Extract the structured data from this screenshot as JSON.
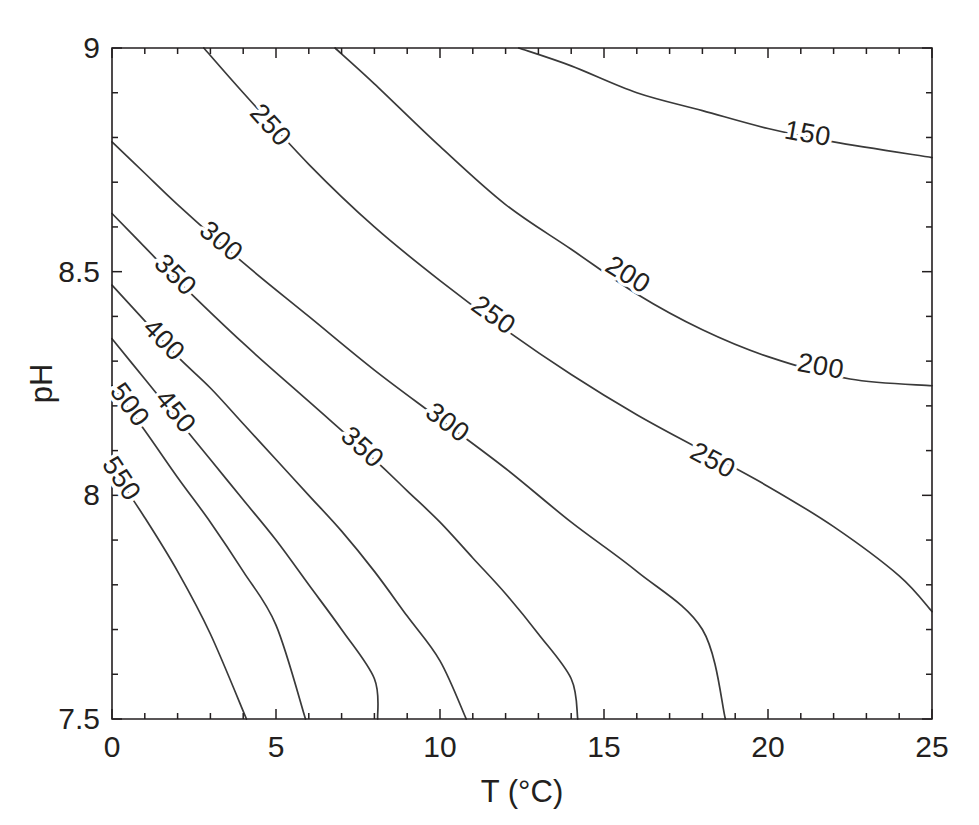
{
  "chart_data": {
    "type": "contour",
    "title": "",
    "xlabel": "T (°C)",
    "ylabel": "pH",
    "xlim": [
      0,
      25
    ],
    "ylim": [
      7.5,
      9
    ],
    "xticks": [
      0,
      5,
      10,
      15,
      20,
      25
    ],
    "xtick_labels": [
      "0",
      "5",
      "10",
      "15",
      "20",
      "25"
    ],
    "xminor_step": 1,
    "yticks": [
      7.5,
      8,
      8.5,
      9
    ],
    "ytick_labels": [
      "7.5",
      "8",
      "8.5",
      "9"
    ],
    "yminor_step": 0.1,
    "grid": false,
    "legend": "none",
    "levels": [
      150,
      200,
      250,
      300,
      350,
      400,
      450,
      500,
      550
    ],
    "level_unit": "",
    "line_color": "#3a3a3a",
    "axis_color": "#231f20",
    "background": "#ffffff",
    "contours": [
      {
        "level": 150,
        "label": "150",
        "points": [
          [
            12.4,
            9.0
          ],
          [
            14.0,
            8.96
          ],
          [
            16.0,
            8.9
          ],
          [
            18.0,
            8.86
          ],
          [
            20.0,
            8.82
          ],
          [
            22.0,
            8.79
          ],
          [
            25.0,
            8.755
          ]
        ],
        "label_at": [
          21.2,
          8.805
        ]
      },
      {
        "level": 200,
        "label": "200",
        "points": [
          [
            6.8,
            9.0
          ],
          [
            8.0,
            8.92
          ],
          [
            10.0,
            8.78
          ],
          [
            12.0,
            8.65
          ],
          [
            14.0,
            8.55
          ],
          [
            16.0,
            8.45
          ],
          [
            18.0,
            8.37
          ],
          [
            20.0,
            8.31
          ],
          [
            22.5,
            8.26
          ],
          [
            25.0,
            8.245
          ]
        ],
        "label_at": [
          15.7,
          8.49
        ],
        "label_at_2": [
          21.6,
          8.285
        ],
        "label2": "200"
      },
      {
        "level": 250,
        "label": "250",
        "points": [
          [
            2.8,
            9.0
          ],
          [
            4.0,
            8.9
          ],
          [
            6.0,
            8.74
          ],
          [
            8.0,
            8.6
          ],
          [
            10.0,
            8.48
          ],
          [
            12.0,
            8.37
          ],
          [
            14.0,
            8.27
          ],
          [
            16.0,
            8.18
          ],
          [
            18.0,
            8.1
          ],
          [
            20.0,
            8.02
          ],
          [
            22.0,
            7.93
          ],
          [
            24.0,
            7.82
          ],
          [
            25.0,
            7.74
          ]
        ],
        "label_at": [
          4.8,
          8.825
        ],
        "label_at_2": [
          11.6,
          8.4
        ],
        "label2": "250",
        "label_at_3": [
          18.3,
          8.075
        ],
        "label3": "250"
      },
      {
        "level": 300,
        "label": "300",
        "points": [
          [
            0.0,
            8.79
          ],
          [
            1.0,
            8.72
          ],
          [
            2.0,
            8.65
          ],
          [
            4.0,
            8.52
          ],
          [
            6.0,
            8.4
          ],
          [
            8.0,
            8.28
          ],
          [
            10.0,
            8.17
          ],
          [
            12.0,
            8.06
          ],
          [
            14.0,
            7.94
          ],
          [
            16.0,
            7.83
          ],
          [
            18.0,
            7.7
          ],
          [
            18.7,
            7.5
          ]
        ],
        "label_at": [
          3.3,
          8.565
        ],
        "label_at_2": [
          10.2,
          8.16
        ],
        "label2": "300"
      },
      {
        "level": 350,
        "label": "350",
        "points": [
          [
            0.0,
            8.63
          ],
          [
            1.0,
            8.555
          ],
          [
            2.0,
            8.48
          ],
          [
            4.0,
            8.34
          ],
          [
            6.0,
            8.21
          ],
          [
            8.0,
            8.08
          ],
          [
            9.0,
            8.01
          ],
          [
            10.0,
            7.94
          ],
          [
            11.0,
            7.86
          ],
          [
            12.0,
            7.78
          ],
          [
            13.0,
            7.69
          ],
          [
            14.0,
            7.59
          ],
          [
            14.2,
            7.5
          ]
        ],
        "label_at": [
          1.9,
          8.49
        ],
        "label_at_2": [
          7.6,
          8.105
        ],
        "label2": "350"
      },
      {
        "level": 400,
        "label": "400",
        "points": [
          [
            0.0,
            8.47
          ],
          [
            1.0,
            8.39
          ],
          [
            2.0,
            8.31
          ],
          [
            3.0,
            8.24
          ],
          [
            4.0,
            8.16
          ],
          [
            5.0,
            8.08
          ],
          [
            6.0,
            8.0
          ],
          [
            7.0,
            7.92
          ],
          [
            8.0,
            7.83
          ],
          [
            9.0,
            7.73
          ],
          [
            10.0,
            7.63
          ],
          [
            10.8,
            7.5
          ]
        ],
        "label_at": [
          1.55,
          8.345
        ]
      },
      {
        "level": 450,
        "label": "450",
        "points": [
          [
            0.0,
            8.35
          ],
          [
            1.0,
            8.26
          ],
          [
            2.0,
            8.17
          ],
          [
            3.0,
            8.08
          ],
          [
            4.0,
            7.99
          ],
          [
            5.0,
            7.9
          ],
          [
            6.0,
            7.8
          ],
          [
            7.0,
            7.7
          ],
          [
            8.0,
            7.59
          ],
          [
            8.1,
            7.5
          ]
        ],
        "label_at": [
          1.9,
          8.185
        ]
      },
      {
        "level": 500,
        "label": "500",
        "points": [
          [
            0.0,
            8.245
          ],
          [
            1.0,
            8.145
          ],
          [
            2.0,
            8.04
          ],
          [
            3.0,
            7.94
          ],
          [
            4.0,
            7.83
          ],
          [
            5.0,
            7.71
          ],
          [
            5.9,
            7.5
          ]
        ],
        "label_at": [
          0.5,
          8.2
        ]
      },
      {
        "level": 550,
        "label": "550",
        "points": [
          [
            0.0,
            8.06
          ],
          [
            1.0,
            7.95
          ],
          [
            2.0,
            7.83
          ],
          [
            3.0,
            7.69
          ],
          [
            4.1,
            7.5
          ]
        ],
        "label_at": [
          0.25,
          8.035
        ]
      }
    ]
  },
  "axes": {
    "x_axis_title": "T (°C)",
    "y_axis_title": "pH",
    "x_tick_labels": [
      "0",
      "5",
      "10",
      "15",
      "20",
      "25"
    ],
    "y_tick_labels": [
      "7.5",
      "8",
      "8.5",
      "9"
    ]
  },
  "contour_labels": [
    "250",
    "300",
    "350",
    "400",
    "450",
    "500",
    "550",
    "150",
    "200",
    "250",
    "200",
    "250",
    "300",
    "350",
    "250"
  ]
}
